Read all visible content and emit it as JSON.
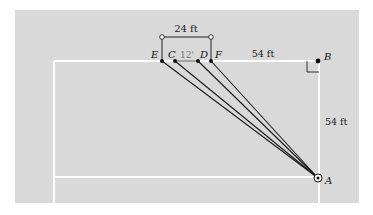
{
  "figure": {
    "panel_color": "#d9d9d9",
    "line_color": "#ffffff",
    "ink_color": "#1a1a1a",
    "dim_color": "#2a2a2a"
  },
  "points": {
    "A": {
      "label": "A",
      "x": 318,
      "y": 178
    },
    "B": {
      "label": "B",
      "x": 318,
      "y": 61
    },
    "C": {
      "label": "C",
      "x": 175,
      "y": 61
    },
    "D": {
      "label": "D",
      "x": 198,
      "y": 61
    },
    "E": {
      "label": "E",
      "x": 162,
      "y": 61
    },
    "F": {
      "label": "F",
      "x": 211,
      "y": 61
    }
  },
  "dimensions": {
    "ef_width": "24 ft",
    "cd_width": "12'",
    "fb_length": "54 ft",
    "ba_length": "54 ft"
  }
}
